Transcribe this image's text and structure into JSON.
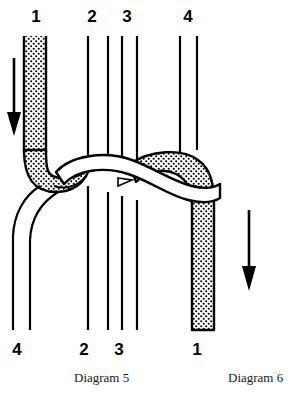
{
  "figure": {
    "type": "knot-tying-diagram",
    "background_color": "#ffffff",
    "ink_color": "#000000",
    "cord_fill_white": "#ffffff",
    "cord_fill_stippled": "#ffffff",
    "stipple_dot_color": "#000000"
  },
  "top_labels": [
    {
      "text": "1",
      "x": 36,
      "y": 8
    },
    {
      "text": "2",
      "x": 92,
      "y": 8
    },
    {
      "text": "3",
      "x": 127,
      "y": 8
    },
    {
      "text": "4",
      "x": 188,
      "y": 8
    }
  ],
  "bottom_labels": [
    {
      "text": "4",
      "x": 17,
      "y": 341
    },
    {
      "text": "2",
      "x": 84,
      "y": 341
    },
    {
      "text": "3",
      "x": 119,
      "y": 341
    },
    {
      "text": "1",
      "x": 197,
      "y": 341
    }
  ],
  "captions": {
    "left": "Diagram 5",
    "right": "Diagram 6"
  },
  "arrows": [
    {
      "name": "left-down-arrow",
      "x": 14,
      "y_start": 58,
      "y_end": 134,
      "direction": "down"
    },
    {
      "name": "right-down-arrow",
      "x": 249,
      "y_start": 210,
      "y_end": 290,
      "direction": "down"
    }
  ],
  "cords": {
    "cord_1": {
      "label": "1",
      "style": "stippled",
      "start_position": "top-left",
      "end_position": "bottom-right",
      "width_px": 22
    },
    "cord_2": {
      "label": "2",
      "style": "plain-line",
      "start_position": "top-center-left",
      "end_position": "bottom-center-left"
    },
    "cord_3": {
      "label": "3",
      "style": "plain-line",
      "start_position": "top-center-right",
      "end_position": "bottom-center-right"
    },
    "cord_4": {
      "label": "4",
      "style": "white-outline",
      "start_position": "top-right",
      "end_position": "bottom-left",
      "width_px": 18
    }
  },
  "vertical_lines_top": [
    88,
    108,
    122,
    137,
    180,
    197
  ],
  "vertical_lines_bottom": [
    13,
    30,
    80,
    100,
    113,
    127
  ]
}
